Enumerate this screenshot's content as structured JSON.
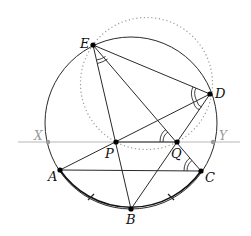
{
  "diagram": {
    "type": "geometry",
    "colors": {
      "line": "#2a2a2a",
      "aux_line": "#b0b0b0",
      "dotted": "#9a9a9a",
      "point": "#000000"
    },
    "circumcircle": {
      "cx": 131,
      "cy": 123,
      "r": 86,
      "style": "solid"
    },
    "auxiliary_circle": {
      "cx": 146.5,
      "cy": 83.5,
      "r": 66,
      "style": "dotted",
      "through": [
        "E",
        "D",
        "P",
        "Q"
      ]
    },
    "xy_line": {
      "y": 142,
      "x1": 18,
      "x2": 240,
      "style": "gray"
    },
    "points": {
      "A": {
        "x": 60,
        "y": 170,
        "label": "A"
      },
      "B": {
        "x": 131,
        "y": 209,
        "label": "B"
      },
      "C": {
        "x": 201,
        "y": 171,
        "label": "C"
      },
      "D": {
        "x": 210,
        "y": 94,
        "label": "D"
      },
      "E": {
        "x": 93,
        "y": 45,
        "label": "E"
      },
      "P": {
        "x": 116,
        "y": 142,
        "label": "P"
      },
      "Q": {
        "x": 177,
        "y": 142,
        "label": "Q"
      },
      "X": {
        "x": 48,
        "y": 142,
        "label": "X"
      },
      "Y": {
        "x": 213,
        "y": 142,
        "label": "Y"
      }
    },
    "segments": [
      [
        "E",
        "B"
      ],
      [
        "E",
        "C"
      ],
      [
        "E",
        "D"
      ],
      [
        "D",
        "A"
      ],
      [
        "D",
        "B"
      ],
      [
        "A",
        "C"
      ],
      [
        "P",
        "Q"
      ]
    ],
    "equal_arcs": [
      "AB",
      "BC"
    ],
    "equal_angles": [
      "PEQ",
      "EDA",
      "ADB",
      "EQP",
      "ECA"
    ]
  }
}
